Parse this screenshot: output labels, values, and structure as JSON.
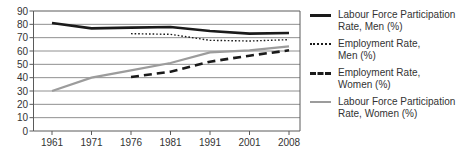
{
  "chart_data": {
    "type": "line",
    "x": [
      1961,
      1971,
      1976,
      1981,
      1991,
      2001,
      2008
    ],
    "series": [
      {
        "name": "Labour Force Participation Rate, Men (%)",
        "style": "solid-black",
        "values": [
          81,
          77,
          77.5,
          78,
          75,
          73,
          73.5
        ]
      },
      {
        "name": "Employment Rate, Men (%)",
        "style": "dotted-black",
        "values": [
          null,
          null,
          73,
          72.5,
          68,
          67.5,
          68.5
        ]
      },
      {
        "name": "Employment Rate, Women (%)",
        "style": "dashed-black",
        "values": [
          null,
          null,
          40.5,
          44.5,
          52,
          56.5,
          60.5
        ]
      },
      {
        "name": "Labour Force Participation Rate, Women (%)",
        "style": "solid-gray",
        "values": [
          30,
          40,
          45.5,
          51,
          59,
          60.5,
          63.5
        ]
      }
    ],
    "title": "",
    "xlabel": "",
    "ylabel": "",
    "ylim": [
      0,
      90
    ],
    "ytick_step": 10,
    "grid": true,
    "legend_position": "right",
    "colors": {
      "black": "#1a1a1a",
      "gray": "#9c9c9c",
      "grid": "#909090",
      "axis": "#5a5a5a",
      "text": "#333333"
    }
  }
}
